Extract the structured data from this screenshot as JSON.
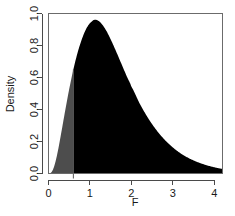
{
  "chart_data": {
    "type": "area",
    "title": "",
    "subtitle": "",
    "xlabel": "F",
    "ylabel": "Density",
    "xlim": [
      0,
      4.2
    ],
    "ylim": [
      0.0,
      1.0
    ],
    "grid": false,
    "legend": null,
    "x_ticks": [
      "0",
      "1",
      "2",
      "3",
      "4"
    ],
    "x_tick_values": [
      0,
      1,
      2,
      3,
      4
    ],
    "y_ticks": [
      "0.0",
      "0.2",
      "0.4",
      "0.6",
      "0.8",
      "1.0"
    ],
    "y_tick_values": [
      0.0,
      0.2,
      0.4,
      0.6,
      0.8,
      1.0
    ],
    "distribution": "F distribution density",
    "peak_x": 0.86,
    "peak_y": 0.96,
    "cut_x": 0.6,
    "regions": [
      {
        "name": "left-tail-shaded",
        "color": "#4d4d4d",
        "x_from": 0.0,
        "x_to": 0.6
      },
      {
        "name": "right-region-shaded",
        "color": "#000000",
        "x_from": 0.6,
        "x_to": 4.2
      }
    ],
    "x": [
      0.0,
      0.05,
      0.1,
      0.15,
      0.2,
      0.25,
      0.3,
      0.35,
      0.4,
      0.45,
      0.5,
      0.55,
      0.6,
      0.65,
      0.7,
      0.75,
      0.8,
      0.85,
      0.9,
      0.95,
      1.0,
      1.1,
      1.2,
      1.3,
      1.4,
      1.5,
      1.6,
      1.7,
      1.8,
      1.9,
      2.0,
      2.2,
      2.4,
      2.6,
      2.8,
      3.0,
      3.2,
      3.4,
      3.6,
      3.8,
      4.0,
      4.2
    ],
    "values": [
      0.0,
      0.003,
      0.02,
      0.056,
      0.108,
      0.172,
      0.243,
      0.316,
      0.389,
      0.46,
      0.528,
      0.591,
      0.65,
      0.704,
      0.753,
      0.797,
      0.836,
      0.87,
      0.899,
      0.922,
      0.94,
      0.96,
      0.955,
      0.93,
      0.89,
      0.839,
      0.782,
      0.722,
      0.661,
      0.601,
      0.543,
      0.438,
      0.348,
      0.273,
      0.212,
      0.163,
      0.124,
      0.094,
      0.071,
      0.053,
      0.039,
      0.029
    ],
    "colors": {
      "left_shade": "#4d4d4d",
      "right_shade": "#000000",
      "axis": "#4a4a4a",
      "frame": "#6b6b6b",
      "background": "#ffffff",
      "text": "#1a1a1a"
    }
  }
}
